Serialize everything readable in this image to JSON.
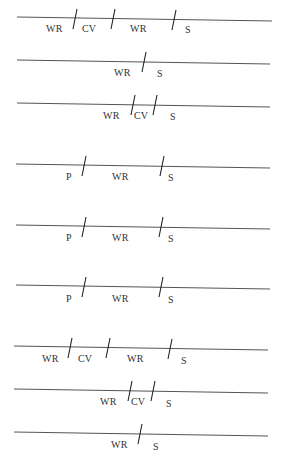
{
  "diagram": {
    "line_color": "#555555",
    "text_color": "#333333",
    "rows": [
      {
        "line": {
          "x1": 17,
          "y1": 17,
          "x2": 272,
          "y2": 21
        },
        "slashes": [
          {
            "x": 75,
            "y": 19
          },
          {
            "x": 113,
            "y": 19
          },
          {
            "x": 174,
            "y": 20
          }
        ],
        "labels": [
          {
            "text": "WR",
            "x": 46,
            "y": 24
          },
          {
            "text": "CV",
            "x": 82,
            "y": 24
          },
          {
            "text": "WR",
            "x": 130,
            "y": 24
          },
          {
            "text": "S",
            "x": 185,
            "y": 25
          }
        ]
      },
      {
        "line": {
          "x1": 17,
          "y1": 60,
          "x2": 270,
          "y2": 64
        },
        "slashes": [
          {
            "x": 144,
            "y": 62
          }
        ],
        "labels": [
          {
            "text": "WR",
            "x": 114,
            "y": 68
          },
          {
            "text": "S",
            "x": 157,
            "y": 69
          }
        ]
      },
      {
        "line": {
          "x1": 17,
          "y1": 103,
          "x2": 270,
          "y2": 107
        },
        "slashes": [
          {
            "x": 133,
            "y": 105
          },
          {
            "x": 155,
            "y": 105
          }
        ],
        "labels": [
          {
            "text": "WR",
            "x": 103,
            "y": 111
          },
          {
            "text": "CV",
            "x": 134,
            "y": 111
          },
          {
            "text": "S",
            "x": 170,
            "y": 112
          }
        ]
      },
      {
        "line": {
          "x1": 16,
          "y1": 164,
          "x2": 270,
          "y2": 168
        },
        "slashes": [
          {
            "x": 84,
            "y": 166
          },
          {
            "x": 162,
            "y": 166
          }
        ],
        "labels": [
          {
            "text": "P",
            "x": 66,
            "y": 172
          },
          {
            "text": "WR",
            "x": 112,
            "y": 172
          },
          {
            "text": "S",
            "x": 168,
            "y": 173
          }
        ]
      },
      {
        "line": {
          "x1": 16,
          "y1": 225,
          "x2": 270,
          "y2": 229
        },
        "slashes": [
          {
            "x": 84,
            "y": 227
          },
          {
            "x": 161,
            "y": 227
          }
        ],
        "labels": [
          {
            "text": "P",
            "x": 66,
            "y": 233
          },
          {
            "text": "WR",
            "x": 112,
            "y": 233
          },
          {
            "text": "S",
            "x": 168,
            "y": 234
          }
        ]
      },
      {
        "line": {
          "x1": 16,
          "y1": 285,
          "x2": 270,
          "y2": 289
        },
        "slashes": [
          {
            "x": 84,
            "y": 287
          },
          {
            "x": 161,
            "y": 287
          }
        ],
        "labels": [
          {
            "text": "P",
            "x": 66,
            "y": 294
          },
          {
            "text": "WR",
            "x": 112,
            "y": 294
          },
          {
            "text": "S",
            "x": 168,
            "y": 295
          }
        ]
      },
      {
        "line": {
          "x1": 14,
          "y1": 346,
          "x2": 268,
          "y2": 350
        },
        "slashes": [
          {
            "x": 70,
            "y": 348
          },
          {
            "x": 108,
            "y": 348
          },
          {
            "x": 170,
            "y": 349
          }
        ],
        "labels": [
          {
            "text": "WR",
            "x": 42,
            "y": 354
          },
          {
            "text": "CV",
            "x": 78,
            "y": 354
          },
          {
            "text": "WR",
            "x": 127,
            "y": 354
          },
          {
            "text": "S",
            "x": 181,
            "y": 356
          }
        ]
      },
      {
        "line": {
          "x1": 14,
          "y1": 389,
          "x2": 268,
          "y2": 393
        },
        "slashes": [
          {
            "x": 130,
            "y": 391
          },
          {
            "x": 153,
            "y": 391
          }
        ],
        "labels": [
          {
            "text": "WR",
            "x": 100,
            "y": 397
          },
          {
            "text": "CV",
            "x": 131,
            "y": 397
          },
          {
            "text": "S",
            "x": 166,
            "y": 399
          }
        ]
      },
      {
        "line": {
          "x1": 14,
          "y1": 432,
          "x2": 268,
          "y2": 436
        },
        "slashes": [
          {
            "x": 140,
            "y": 434
          }
        ],
        "labels": [
          {
            "text": "WR",
            "x": 111,
            "y": 440
          },
          {
            "text": "S",
            "x": 153,
            "y": 442
          }
        ]
      }
    ]
  }
}
